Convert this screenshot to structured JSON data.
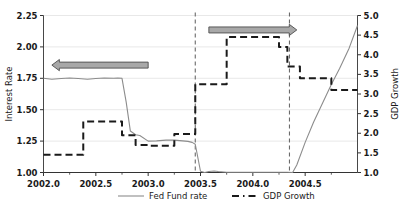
{
  "chart_data": {
    "type": "line",
    "title": "",
    "xlabel": "",
    "ylabel": "Interest Rate",
    "y2label": "GDP Growth",
    "xlim": [
      2002.0,
      2005.0
    ],
    "ylim": [
      1.0,
      2.25
    ],
    "y2lim": [
      1.0,
      5.0
    ],
    "grid": true,
    "legend_position": "bottom",
    "xticks": [
      2002.0,
      2002.5,
      2003.0,
      2003.5,
      2004.0,
      2004.5
    ],
    "xticklabels": [
      "2002.0",
      "2002.5",
      "2003.0",
      "2003.5",
      "2004.0",
      "2004.5"
    ],
    "yticks": [
      1.0,
      1.25,
      1.5,
      1.75,
      2.0,
      2.25
    ],
    "yticklabels": [
      "1.00",
      "1.25",
      "1.50",
      "1.75",
      "2.00",
      "2.25"
    ],
    "y2ticks": [
      1.0,
      1.5,
      2.0,
      2.5,
      3.0,
      3.5,
      4.0,
      4.5,
      5.0
    ],
    "y2ticklabels": [
      "1.0",
      "1.5",
      "2.0",
      "2.5",
      "3.0",
      "3.5",
      "4.0",
      "4.5",
      "5.0"
    ],
    "series": [
      {
        "name": "Fed Fund rate",
        "axis": "left",
        "style": "solid",
        "color": "#8c8c8c",
        "width": 1.1,
        "x": [
          2002.0,
          2002.08,
          2002.17,
          2002.25,
          2002.33,
          2002.42,
          2002.5,
          2002.58,
          2002.67,
          2002.71,
          2002.75,
          2002.79,
          2002.83,
          2002.88,
          2002.92,
          2003.0,
          2003.08,
          2003.17,
          2003.25,
          2003.33,
          2003.38,
          2003.42,
          2003.45,
          2003.5,
          2003.54,
          2003.58,
          2003.63,
          2003.67,
          2003.75,
          2003.83,
          2003.92,
          2004.0,
          2004.08,
          2004.17,
          2004.25,
          2004.33,
          2004.38,
          2004.42,
          2004.5,
          2004.58,
          2004.67,
          2004.75,
          2004.83,
          2004.92,
          2005.0
        ],
        "y": [
          1.75,
          1.742,
          1.748,
          1.752,
          1.748,
          1.742,
          1.748,
          1.752,
          1.75,
          1.752,
          1.75,
          1.56,
          1.33,
          1.3,
          1.295,
          1.25,
          1.252,
          1.258,
          1.258,
          1.252,
          1.248,
          1.24,
          1.225,
          1.01,
          1.0,
          1.008,
          1.012,
          1.008,
          1.002,
          1.002,
          1.002,
          1.002,
          1.002,
          1.002,
          1.002,
          1.002,
          1.0,
          1.06,
          1.24,
          1.4,
          1.56,
          1.7,
          1.83,
          1.99,
          2.17
        ]
      },
      {
        "name": "GDP Growth",
        "axis": "right",
        "style": "dashed",
        "color": "#1a1a1a",
        "width": 2.0,
        "x": [
          2002.0,
          2002.38,
          2002.38,
          2002.5,
          2002.5,
          2002.75,
          2002.75,
          2002.88,
          2002.88,
          2003.0,
          2003.0,
          2003.25,
          2003.25,
          2003.45,
          2003.45,
          2003.5,
          2003.5,
          2003.75,
          2003.75,
          2004.25,
          2004.25,
          2004.33,
          2004.33,
          2004.45,
          2004.45,
          2004.75,
          2004.75,
          2005.0
        ],
        "y": [
          1.45,
          1.45,
          2.3,
          2.3,
          2.3,
          2.3,
          1.95,
          1.95,
          1.7,
          1.7,
          1.68,
          1.68,
          1.98,
          1.98,
          3.25,
          3.25,
          3.25,
          3.25,
          4.45,
          4.45,
          4.2,
          4.2,
          3.7,
          3.7,
          3.4,
          3.4,
          3.1,
          3.1
        ]
      }
    ],
    "vlines": [
      {
        "x": 2003.45,
        "style": "dashed",
        "color": "#6b6b6b"
      },
      {
        "x": 2004.35,
        "style": "dashed",
        "color": "#6b6b6b"
      }
    ],
    "annotations": [
      {
        "name": "left-arrow-annotation",
        "direction": "left",
        "x_start": 2002.08,
        "x_end": 2003.0,
        "y": 1.855
      },
      {
        "name": "right-arrow-annotation",
        "direction": "right",
        "x_start": 2003.58,
        "x_end": 2004.42,
        "y": 2.135
      }
    ]
  },
  "legend": {
    "entries": [
      {
        "label": "Fed Fund rate",
        "style": "solid",
        "color": "#8c8c8c"
      },
      {
        "label": "GDP Growth",
        "style": "dashed",
        "color": "#1a1a1a"
      }
    ]
  },
  "colors": {
    "axis": "#333333",
    "grid": "#e2e2e2",
    "arrow_fill": "#a8a8a8",
    "arrow_stroke": "#4d4d4d",
    "background": "#ffffff",
    "text": "#1a1a1a"
  }
}
